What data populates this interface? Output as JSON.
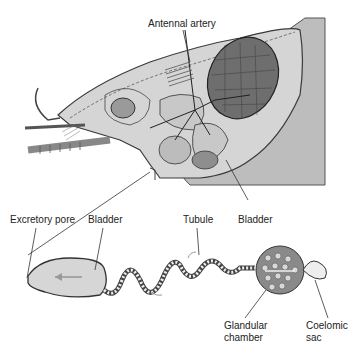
{
  "diagram": {
    "top": {
      "labels": {
        "antennal_artery": "Antennal artery"
      }
    },
    "bottom": {
      "labels": {
        "excretory_pore": "Excretory pore",
        "bladder_left": "Bladder",
        "tubule": "Tubule",
        "bladder_right": "Bladder",
        "glandular_chamber_1": "Glandular",
        "glandular_chamber_2": "chamber",
        "coelomic_sac_1": "Coelomic",
        "coelomic_sac_2": "sac"
      }
    },
    "colors": {
      "body_fill": "#cfcfcf",
      "body_dark": "#8a8a8a",
      "outline": "#3a3a3a",
      "bladder_fill": "#d6d6d6",
      "arrow": "#999999",
      "background": "#ffffff"
    }
  }
}
